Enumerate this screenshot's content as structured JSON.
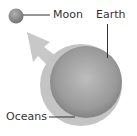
{
  "diagram": {
    "labels": {
      "moon": "Moon",
      "earth": "Earth",
      "oceans": "Oceans"
    },
    "colors": {
      "background": "#ffffff",
      "moon_fill": "#8a8a8a",
      "earth_fill": "#9a9a9a",
      "ocean_layer": "#c4c4c4",
      "arrow_fill": "#c8c8c8",
      "leader_line": "#333333",
      "text": "#333333"
    }
  }
}
